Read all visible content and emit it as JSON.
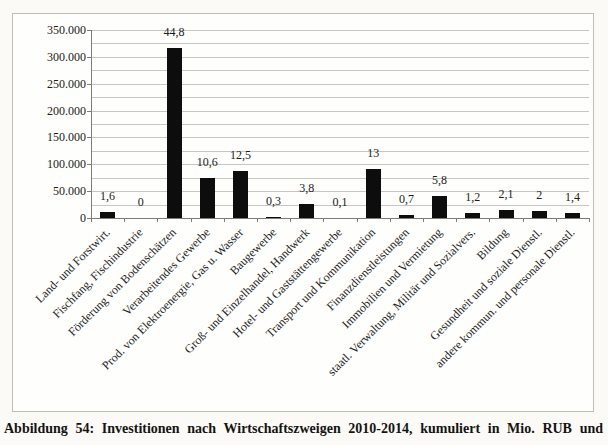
{
  "figure": {
    "caption": "Abbildung 54: Investitionen nach Wirtschaftszweigen 2010-2014, kumuliert in Mio. RUB und"
  },
  "colors": {
    "page_bg": "#fbfaf7",
    "chart_bg": "#fefefd",
    "chart_border": "#bcbcb8",
    "gridline": "#c6c6c2",
    "axis": "#7c7c78",
    "bar": "#0d0d0d",
    "text": "#1c1c1a"
  },
  "chart_data": {
    "type": "bar",
    "title": "",
    "xlabel": "",
    "ylabel": "",
    "legend": false,
    "grid": true,
    "ylim": [
      0,
      350000
    ],
    "ytick_step": 50000,
    "minor_grid_step": 25000,
    "ytick_labels": [
      "0",
      "50.000",
      "100.000",
      "150.000",
      "200.000",
      "250.000",
      "300.000",
      "350.000"
    ],
    "categories": [
      "Land- und Forstwirt.",
      "Fischfang, Fischindustrie",
      "Förderung von Bodenschätzen",
      "Verarbeitendes Gewerbe",
      "Prod. von Elektroenergie, Gas u. Wasser",
      "Baugewerbe",
      "Groß- und Einzelhandel, Handwerk",
      "Hotel- und Gaststättengewerbe",
      "Transport und Kommunikation",
      "Finanzdienstleistungen",
      "Immobilien und Vermietung",
      "staatl. Verwaltung, Militär und Sozialvers.",
      "Bildung",
      "Gesundheit und soziale Dienstl.",
      "andere kommun. und personale Dienstl."
    ],
    "bar_labels": [
      "1,6",
      "0",
      "44,8",
      "10,6",
      "12,5",
      "0,3",
      "3,8",
      "0,1",
      "13",
      "0,7",
      "5,8",
      "1,2",
      "2,1",
      "2",
      "1,4"
    ],
    "values_mio_rub_estimated": [
      11500,
      0,
      317000,
      75000,
      88000,
      2500,
      27000,
      700,
      92000,
      5000,
      41000,
      8800,
      15000,
      14000,
      10000
    ]
  }
}
